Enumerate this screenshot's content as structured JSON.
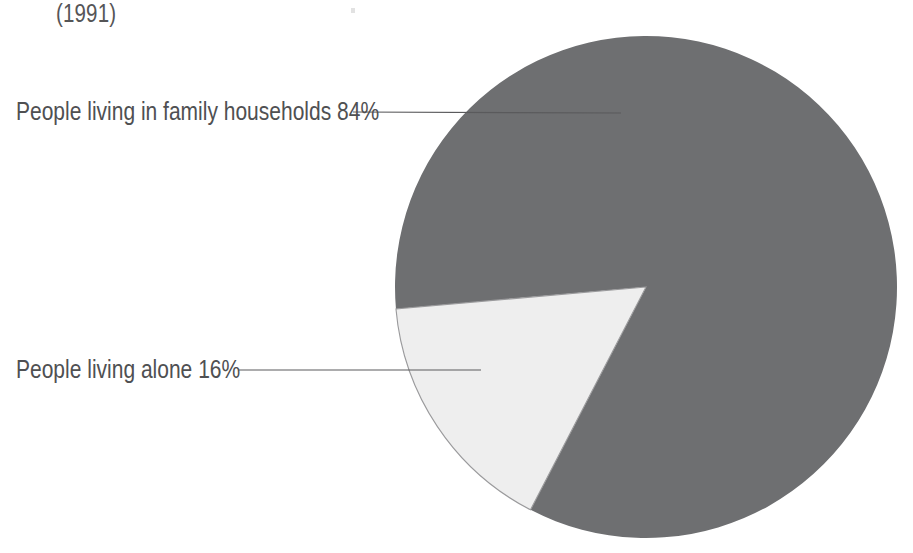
{
  "figure": {
    "caption": "(1991)",
    "background_color": "#ffffff"
  },
  "labels": {
    "family": "People living in family households  84%",
    "alone": "People living alone  16%"
  },
  "chart_data": {
    "type": "pie",
    "title": "(1991)",
    "subtitle": "",
    "xlabel": "",
    "ylabel": "",
    "unit": "%",
    "legend_position": "external-left-with-leader-lines",
    "grid": false,
    "categories": [
      "People living in family households",
      "People living alone"
    ],
    "values": [
      84,
      16
    ],
    "value_labels": [
      "84%",
      "16%"
    ],
    "colors": [
      "#6e6f71",
      "#eeeeee"
    ],
    "slices": [
      {
        "label": "People living in family households",
        "value": 84,
        "value_label": "84%",
        "color": "#6e6f71",
        "start_angle_deg": 239,
        "end_angle_deg": 185
      },
      {
        "label": "People living alone",
        "value": 16,
        "value_label": "16%",
        "color": "#eeeeee",
        "start_angle_deg": 185,
        "end_angle_deg": 239
      }
    ],
    "annotations": [
      {
        "text": "People living in family households  84%",
        "leader_line": {
          "x1": 353,
          "y1": 112,
          "x2": 621,
          "y2": 113
        }
      },
      {
        "text": "People living alone  16%",
        "leader_line": {
          "x1": 238,
          "y1": 370,
          "x2": 481,
          "y2": 370
        }
      }
    ],
    "geometry": {
      "center_x": 646,
      "center_y": 287,
      "radius": 251
    }
  },
  "style": {
    "slice_dark": "#6e6f71",
    "slice_light": "#eeeeee",
    "slice_light_edge": "#9a9a9c",
    "leader_line_color": "#5a5a5c",
    "text_color": "#4f5052"
  }
}
